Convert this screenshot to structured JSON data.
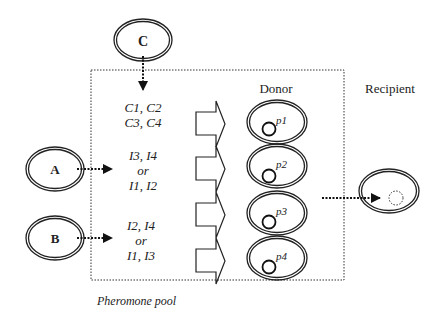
{
  "sources": [
    {
      "id": "C",
      "label": "C"
    },
    {
      "id": "A",
      "label": "A"
    },
    {
      "id": "B",
      "label": "B"
    }
  ],
  "pheromone_groups": [
    {
      "lines": [
        "C1, C2",
        "C3, C4"
      ]
    },
    {
      "lines": [
        "I3, I4",
        "or",
        "I1, I2"
      ]
    },
    {
      "lines": [
        "I2, I4",
        "or",
        "I1, I3"
      ]
    }
  ],
  "pool_label": "Pheromone pool",
  "donor_label": "Donor",
  "recipient_label": "Recipient",
  "donor_cells": [
    {
      "plasmid": "p1"
    },
    {
      "plasmid": "p2"
    },
    {
      "plasmid": "p3"
    },
    {
      "plasmid": "p4"
    }
  ],
  "colors": {
    "stroke": "#222222",
    "background": "#ffffff"
  }
}
